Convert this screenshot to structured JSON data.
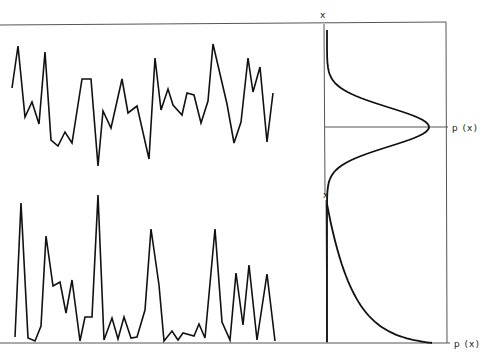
{
  "figure": {
    "top_panel": {
      "axis_label_vertical": "x",
      "axis_label_horizontal": "p (x)",
      "description": "random signal with gaussian amplitude distribution"
    },
    "bottom_panel": {
      "axis_label_vertical": "x",
      "axis_label_horizontal": "p (x)",
      "description": "random spiky signal with exponential amplitude distribution"
    }
  },
  "chart_data": [
    {
      "type": "line",
      "title": "",
      "xlabel": "",
      "ylabel": "",
      "points": [
        [
          12,
          88
        ],
        [
          18,
          46
        ],
        [
          25,
          117
        ],
        [
          32,
          102
        ],
        [
          39,
          124
        ],
        [
          45,
          52
        ],
        [
          51,
          140
        ],
        [
          58,
          146
        ],
        [
          65,
          132
        ],
        [
          72,
          143
        ],
        [
          82,
          79
        ],
        [
          91,
          79
        ],
        [
          98,
          166
        ],
        [
          103,
          111
        ],
        [
          111,
          128
        ],
        [
          122,
          79
        ],
        [
          128,
          113
        ],
        [
          137,
          106
        ],
        [
          149,
          159
        ],
        [
          155,
          58
        ],
        [
          161,
          110
        ],
        [
          168,
          89
        ],
        [
          173,
          105
        ],
        [
          182,
          115
        ],
        [
          187,
          93
        ],
        [
          194,
          95
        ],
        [
          201,
          123
        ],
        [
          208,
          101
        ],
        [
          213,
          44
        ],
        [
          227,
          104
        ],
        [
          234,
          143
        ],
        [
          241,
          122
        ],
        [
          248,
          58
        ],
        [
          253,
          92
        ],
        [
          260,
          67
        ],
        [
          267,
          142
        ],
        [
          273,
          93
        ]
      ]
    },
    {
      "type": "line",
      "title": "Gaussian PDF (rotated)",
      "xlabel": "p (x)",
      "ylabel": "x",
      "shape": "gaussian",
      "peak_y": 127,
      "peak_x": 429,
      "base_x": 327,
      "sigma_px": 17
    },
    {
      "type": "line",
      "title": "",
      "xlabel": "",
      "ylabel": "",
      "points": [
        [
          15,
          337
        ],
        [
          21,
          203
        ],
        [
          28,
          338
        ],
        [
          35,
          341
        ],
        [
          41,
          326
        ],
        [
          46,
          236
        ],
        [
          53,
          286
        ],
        [
          60,
          282
        ],
        [
          66,
          313
        ],
        [
          72,
          280
        ],
        [
          80,
          341
        ],
        [
          85,
          317
        ],
        [
          92,
          317
        ],
        [
          98,
          195
        ],
        [
          104,
          340
        ],
        [
          112,
          318
        ],
        [
          118,
          339
        ],
        [
          124,
          317
        ],
        [
          131,
          338
        ],
        [
          137,
          337
        ],
        [
          145,
          310
        ],
        [
          151,
          229
        ],
        [
          159,
          285
        ],
        [
          164,
          341
        ],
        [
          172,
          331
        ],
        [
          178,
          340
        ],
        [
          183,
          333
        ],
        [
          194,
          336
        ],
        [
          199,
          324
        ],
        [
          205,
          338
        ],
        [
          215,
          229
        ],
        [
          222,
          322
        ],
        [
          230,
          340
        ],
        [
          236,
          273
        ],
        [
          243,
          325
        ],
        [
          249,
          265
        ],
        [
          257,
          340
        ],
        [
          267,
          274
        ],
        [
          275,
          341
        ]
      ]
    },
    {
      "type": "line",
      "title": "Exponential PDF (rotated)",
      "xlabel": "p (x)",
      "ylabel": "x",
      "shape": "exponential",
      "start": [
        327,
        204
      ],
      "end": [
        432,
        343
      ]
    }
  ]
}
